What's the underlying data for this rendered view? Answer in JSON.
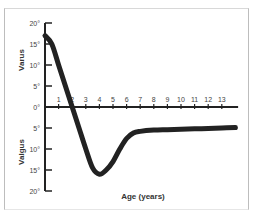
{
  "chart_data": {
    "type": "line",
    "title": "",
    "xlabel": "Age (years)",
    "ylabel_upper": "Varus",
    "ylabel_lower": "Valgus",
    "x_ticks": [
      "1",
      "2",
      "3",
      "4",
      "5",
      "6",
      "7",
      "8",
      "9",
      "10",
      "11",
      "12",
      "13"
    ],
    "y_ticks": [
      "20°",
      "15°",
      "10°",
      "5°",
      "0°",
      "5°",
      "10°",
      "15°",
      "20°"
    ],
    "ylim": [
      -20,
      20
    ],
    "xlim": [
      0,
      14
    ],
    "grid": false,
    "legend": null,
    "series": [
      {
        "name": "Tibiofemoral angle",
        "x": [
          0,
          0.5,
          1,
          1.5,
          2,
          2.5,
          3,
          3.5,
          4,
          4.5,
          5,
          5.5,
          6,
          6.5,
          7,
          8,
          9,
          10,
          11,
          12,
          13,
          14
        ],
        "y": [
          17,
          15,
          10,
          5,
          0,
          -5,
          -10,
          -14.5,
          -16,
          -15,
          -13,
          -10,
          -7.5,
          -6.2,
          -5.8,
          -5.5,
          -5.4,
          -5.3,
          -5.2,
          -5.1,
          -5.0,
          -4.9
        ]
      }
    ]
  },
  "labels": {
    "varus": "Varus",
    "valgus": "Valgus",
    "xlabel": "Age (years)"
  },
  "colors": {
    "line": "#222222",
    "axis": "#222222",
    "text": "#333333"
  }
}
